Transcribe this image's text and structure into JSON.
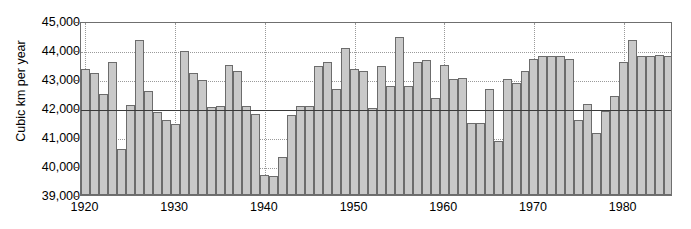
{
  "chart_data": {
    "type": "bar",
    "title": "",
    "xlabel": "",
    "ylabel": "Cubic km per year",
    "ylim": [
      39000,
      45000
    ],
    "xlim": [
      1919.5,
      1985.5
    ],
    "ytick_values": [
      39000,
      40000,
      41000,
      42000,
      43000,
      44000,
      45000
    ],
    "ytick_labels": [
      "39,000",
      "40,000",
      "41,000",
      "42,000",
      "43,000",
      "44,000",
      "45,000"
    ],
    "xtick_values": [
      1920,
      1930,
      1940,
      1950,
      1960,
      1970,
      1980
    ],
    "xtick_labels": [
      "1920",
      "1930",
      "1940",
      "1950",
      "1960",
      "1970",
      "1980"
    ],
    "grid": "dotted horizontal gridlines at every 1,000 and dotted vertical gridlines at each decade",
    "legend": "none",
    "reference_line": {
      "value": 42000,
      "label": "",
      "style": "solid"
    },
    "bar_fill_color": "#c9c9c9",
    "bar_edge_color": "#6c6c6c",
    "gridline_color": "#9a9a9a",
    "axis_color": "#6f6f6f",
    "reference_line_color": "#3a3a3a",
    "categories": [
      "1920",
      "1921",
      "1922",
      "1923",
      "1924",
      "1925",
      "1926",
      "1927",
      "1928",
      "1929",
      "1930",
      "1931",
      "1932",
      "1933",
      "1934",
      "1935",
      "1936",
      "1937",
      "1938",
      "1939",
      "1940",
      "1941",
      "1942",
      "1943",
      "1944",
      "1945",
      "1946",
      "1947",
      "1948",
      "1949",
      "1950",
      "1951",
      "1952",
      "1953",
      "1954",
      "1955",
      "1956",
      "1957",
      "1958",
      "1959",
      "1960",
      "1961",
      "1962",
      "1963",
      "1964",
      "1965",
      "1966",
      "1967",
      "1968",
      "1969",
      "1970",
      "1971",
      "1972",
      "1973",
      "1974",
      "1975",
      "1976",
      "1977",
      "1978",
      "1979",
      "1980",
      "1981",
      "1982",
      "1983",
      "1984",
      "1985"
    ],
    "values": [
      43350,
      43200,
      42500,
      43570,
      40580,
      42120,
      44350,
      42600,
      41870,
      41600,
      41450,
      43960,
      43200,
      42950,
      42050,
      42080,
      43480,
      43270,
      42060,
      41800,
      39680,
      39670,
      40320,
      41750,
      42080,
      42080,
      43450,
      43600,
      42650,
      44080,
      43350,
      43280,
      42000,
      43450,
      42760,
      44450,
      42770,
      43600,
      43650,
      42340,
      43500,
      43000,
      43050,
      41500,
      41470,
      42650,
      40870,
      43000,
      42850,
      43280,
      43700,
      43800,
      43800,
      43800,
      43700,
      41600,
      42150,
      41150,
      41900,
      42400,
      43600,
      44350,
      43800,
      43800,
      43820,
      43800
    ]
  }
}
